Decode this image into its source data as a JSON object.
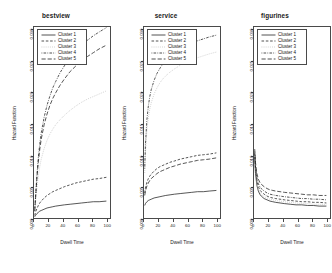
{
  "chart_data": [
    {
      "type": "line",
      "title": "bestview",
      "xlabel": "Dwell Time",
      "ylabel": "Hazard Function",
      "xlim": [
        0,
        105
      ],
      "ylim": [
        0.0,
        0.0305
      ],
      "xticks": [
        0,
        20,
        40,
        60,
        80,
        100
      ],
      "yticks": [
        0.0,
        0.005,
        0.01,
        0.015,
        0.02,
        0.025,
        0.03
      ],
      "ytick_labels": [
        "0.000",
        "0.005",
        "0.010",
        "0.015",
        "0.020",
        "0.025",
        "0.030"
      ],
      "xtick_labels": [
        "0",
        "20",
        "40",
        "60",
        "80",
        "100"
      ],
      "grid": false,
      "legend_position": "top-left",
      "x": [
        1,
        2,
        4,
        6,
        8,
        10,
        14,
        18,
        22,
        26,
        30,
        36,
        42,
        50,
        58,
        66,
        74,
        82,
        90,
        100
      ],
      "series": [
        {
          "name": "Cluster 1",
          "style": "solid",
          "color": "#1a1a1a",
          "values": [
            0.0002,
            0.0004,
            0.0007,
            0.0009,
            0.0011,
            0.0012,
            0.0014,
            0.0016,
            0.0017,
            0.0018,
            0.0019,
            0.002,
            0.0021,
            0.0022,
            0.0023,
            0.0024,
            0.0025,
            0.0026,
            0.0026,
            0.0027
          ]
        },
        {
          "name": "Cluster 2",
          "style": "dashed",
          "color": "#1a1a1a",
          "values": [
            0.0004,
            0.0009,
            0.0015,
            0.002,
            0.0024,
            0.0027,
            0.0032,
            0.0036,
            0.0039,
            0.0042,
            0.0044,
            0.0047,
            0.005,
            0.0053,
            0.0056,
            0.0058,
            0.006,
            0.0062,
            0.0063,
            0.0065
          ]
        },
        {
          "name": "Cluster 3",
          "style": "dotted",
          "color": "#b9b9b9",
          "values": [
            0.001,
            0.0024,
            0.0048,
            0.0067,
            0.0082,
            0.0094,
            0.0111,
            0.0124,
            0.0134,
            0.0142,
            0.0149,
            0.0157,
            0.0164,
            0.0172,
            0.0179,
            0.0185,
            0.019,
            0.0194,
            0.0198,
            0.0203
          ]
        },
        {
          "name": "Cluster 4",
          "style": "dotdash",
          "color": "#1a1a1a",
          "values": [
            0.0012,
            0.0032,
            0.0068,
            0.0097,
            0.0119,
            0.0136,
            0.0161,
            0.018,
            0.0195,
            0.0208,
            0.0218,
            0.0232,
            0.0243,
            0.0256,
            0.0267,
            0.0276,
            0.0284,
            0.0291,
            0.0297,
            0.0304
          ]
        },
        {
          "name": "Cluster 5",
          "style": "longdash",
          "color": "#1a1a1a",
          "values": [
            0.0011,
            0.003,
            0.0063,
            0.009,
            0.011,
            0.0126,
            0.0149,
            0.0166,
            0.018,
            0.0191,
            0.02,
            0.0212,
            0.0222,
            0.0234,
            0.0243,
            0.0251,
            0.0258,
            0.0264,
            0.027,
            0.0276
          ]
        }
      ]
    },
    {
      "type": "line",
      "title": "service",
      "xlabel": "Dwell Time",
      "ylabel": "Hazard Function",
      "xlim": [
        0,
        105
      ],
      "ylim": [
        0.0,
        0.0305
      ],
      "xticks": [
        0,
        20,
        40,
        60,
        80,
        100
      ],
      "yticks": [
        0.0,
        0.005,
        0.01,
        0.015,
        0.02,
        0.025,
        0.03
      ],
      "ytick_labels": [
        "0.000",
        "0.005",
        "0.010",
        "0.015",
        "0.020",
        "0.025",
        "0.030"
      ],
      "xtick_labels": [
        "0",
        "20",
        "40",
        "60",
        "80",
        "100"
      ],
      "grid": false,
      "legend_position": "top-left",
      "x": [
        1,
        2,
        4,
        6,
        8,
        10,
        14,
        18,
        22,
        26,
        30,
        36,
        42,
        50,
        58,
        66,
        74,
        82,
        90,
        100
      ],
      "series": [
        {
          "name": "Cluster 1",
          "style": "solid",
          "color": "#1a1a1a",
          "values": [
            0.002,
            0.0023,
            0.0026,
            0.0028,
            0.0029,
            0.003,
            0.0032,
            0.0033,
            0.0034,
            0.0035,
            0.0036,
            0.0037,
            0.0038,
            0.0039,
            0.004,
            0.0041,
            0.0042,
            0.0042,
            0.0043,
            0.0044
          ]
        },
        {
          "name": "Cluster 2",
          "style": "dashed",
          "color": "#1a1a1a",
          "values": [
            0.004,
            0.0048,
            0.0057,
            0.0063,
            0.0067,
            0.007,
            0.0075,
            0.0079,
            0.0082,
            0.0084,
            0.0086,
            0.0089,
            0.0091,
            0.0094,
            0.0096,
            0.0098,
            0.01,
            0.0101,
            0.0102,
            0.0104
          ]
        },
        {
          "name": "Cluster 3",
          "style": "dotted",
          "color": "#b9b9b9",
          "values": [
            0.0072,
            0.0105,
            0.014,
            0.016,
            0.0174,
            0.0184,
            0.0198,
            0.0208,
            0.0216,
            0.0222,
            0.0227,
            0.0233,
            0.0238,
            0.0244,
            0.0249,
            0.0253,
            0.0256,
            0.0259,
            0.0262,
            0.0265
          ]
        },
        {
          "name": "Cluster 4",
          "style": "dotdash",
          "color": "#1a1a1a",
          "values": [
            0.0079,
            0.0118,
            0.0157,
            0.0179,
            0.0194,
            0.0205,
            0.022,
            0.0231,
            0.0239,
            0.0246,
            0.0251,
            0.0258,
            0.0263,
            0.027,
            0.0275,
            0.0279,
            0.0283,
            0.0286,
            0.0289,
            0.0292
          ]
        },
        {
          "name": "Cluster 5",
          "style": "longdash",
          "color": "#1a1a1a",
          "values": [
            0.0036,
            0.0043,
            0.0051,
            0.0056,
            0.006,
            0.0063,
            0.0067,
            0.0071,
            0.0074,
            0.0076,
            0.0078,
            0.0081,
            0.0083,
            0.0086,
            0.0088,
            0.009,
            0.0092,
            0.0093,
            0.0094,
            0.0096
          ]
        }
      ]
    },
    {
      "type": "line",
      "title": "figurines",
      "xlabel": "Dwell Time",
      "ylabel": "Hazard Function",
      "xlim": [
        0,
        105
      ],
      "ylim": [
        0.0,
        0.0305
      ],
      "xticks": [
        0,
        20,
        40,
        60,
        80,
        100
      ],
      "yticks": [
        0.0,
        0.005,
        0.01,
        0.015,
        0.02,
        0.025,
        0.03
      ],
      "ytick_labels": [
        "0.000",
        "0.005",
        "0.010",
        "0.015",
        "0.020",
        "0.025",
        "0.030"
      ],
      "xtick_labels": [
        "0",
        "20",
        "40",
        "60",
        "80",
        "100"
      ],
      "grid": false,
      "legend_position": "top-left",
      "x": [
        1,
        2,
        4,
        6,
        8,
        10,
        14,
        18,
        22,
        26,
        30,
        36,
        42,
        50,
        58,
        66,
        74,
        82,
        90,
        100
      ],
      "series": [
        {
          "name": "Cluster 1",
          "style": "solid",
          "color": "#1a1a1a",
          "values": [
            0.0098,
            0.0072,
            0.0052,
            0.0043,
            0.0038,
            0.0035,
            0.0031,
            0.0029,
            0.0027,
            0.0026,
            0.0025,
            0.0024,
            0.0023,
            0.0022,
            0.0021,
            0.0021,
            0.002,
            0.002,
            0.0019,
            0.0019
          ]
        },
        {
          "name": "Cluster 2",
          "style": "dashed",
          "color": "#1a1a1a",
          "values": [
            0.0104,
            0.0079,
            0.0059,
            0.005,
            0.0045,
            0.0042,
            0.0038,
            0.0035,
            0.0033,
            0.0032,
            0.0031,
            0.003,
            0.0029,
            0.0028,
            0.0027,
            0.0026,
            0.0026,
            0.0025,
            0.0025,
            0.0024
          ]
        },
        {
          "name": "Cluster 3",
          "style": "dotted",
          "color": "#b9b9b9",
          "values": [
            0.0101,
            0.0075,
            0.0055,
            0.0046,
            0.0041,
            0.0038,
            0.0034,
            0.0032,
            0.003,
            0.0029,
            0.0028,
            0.0027,
            0.0026,
            0.0025,
            0.0024,
            0.0023,
            0.0023,
            0.0022,
            0.0022,
            0.0021
          ]
        },
        {
          "name": "Cluster 4",
          "style": "dotdash",
          "color": "#1a1a1a",
          "values": [
            0.0106,
            0.0083,
            0.0064,
            0.0055,
            0.005,
            0.0047,
            0.0043,
            0.004,
            0.0038,
            0.0037,
            0.0036,
            0.0035,
            0.0034,
            0.0033,
            0.0032,
            0.0031,
            0.0031,
            0.003,
            0.003,
            0.0029
          ]
        },
        {
          "name": "Cluster 5",
          "style": "longdash",
          "color": "#1a1a1a",
          "values": [
            0.011,
            0.0089,
            0.0071,
            0.0062,
            0.0057,
            0.0054,
            0.005,
            0.0047,
            0.0045,
            0.0044,
            0.0043,
            0.0042,
            0.0041,
            0.004,
            0.0039,
            0.0038,
            0.0037,
            0.0037,
            0.0036,
            0.0036
          ]
        }
      ]
    }
  ]
}
